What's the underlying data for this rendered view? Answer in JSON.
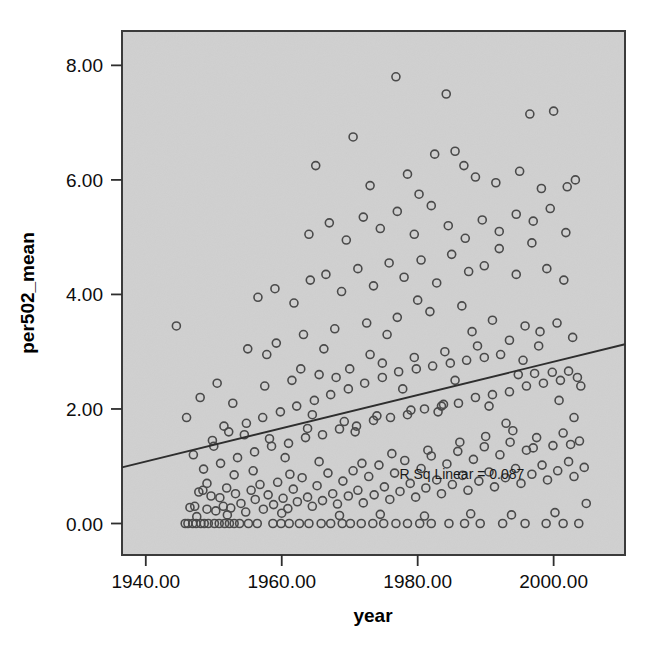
{
  "chart_data": {
    "type": "scatter",
    "title": "",
    "xlabel": "year",
    "ylabel": "per502_mean",
    "xlim": [
      1936.5,
      2010.5
    ],
    "ylim": [
      -0.55,
      8.6
    ],
    "xticks": [
      "1940.00",
      "1960.00",
      "1980.00",
      "2000.00"
    ],
    "xtick_values": [
      1940,
      1960,
      1980,
      2000
    ],
    "yticks": [
      "0.00",
      "2.00",
      "4.00",
      "6.00",
      "8.00"
    ],
    "ytick_values": [
      0,
      2,
      4,
      6,
      8
    ],
    "grid": false,
    "legend": null,
    "annotations": [
      {
        "text": "R Sq Linear = 0.087",
        "x": 1986.5,
        "y": 0.78
      }
    ],
    "fit_line": {
      "type": "linear",
      "r_squared": 0.087,
      "x_start": 1936.5,
      "y_start": 0.98,
      "x_end": 2010.5,
      "y_end": 3.13
    },
    "marker": {
      "shape": "circle",
      "filled": false,
      "edge_color": "#4a4a4a",
      "size_px": 8
    },
    "plot_background": "#dcdcdc",
    "frame_color": "#3a3a3a",
    "points": [
      [
        1944.5,
        3.45
      ],
      [
        1945.8,
        0.0
      ],
      [
        1946.2,
        0.0
      ],
      [
        1946.9,
        0.0
      ],
      [
        1947.4,
        0.0
      ],
      [
        1948.1,
        0.0
      ],
      [
        1948.6,
        0.0
      ],
      [
        1949.2,
        0.0
      ],
      [
        1950.1,
        0.0
      ],
      [
        1950.8,
        0.0
      ],
      [
        1951.6,
        0.0
      ],
      [
        1952.3,
        0.0
      ],
      [
        1953.0,
        0.0
      ],
      [
        1953.8,
        0.0
      ],
      [
        1955.1,
        0.0
      ],
      [
        1956.4,
        0.0
      ],
      [
        1958.7,
        0.0
      ],
      [
        1959.9,
        0.0
      ],
      [
        1961.1,
        0.0
      ],
      [
        1962.6,
        0.0
      ],
      [
        1964.0,
        0.0
      ],
      [
        1965.8,
        0.0
      ],
      [
        1967.2,
        0.0
      ],
      [
        1968.9,
        0.0
      ],
      [
        1970.1,
        0.0
      ],
      [
        1971.7,
        0.0
      ],
      [
        1973.4,
        0.0
      ],
      [
        1975.0,
        0.0
      ],
      [
        1976.8,
        0.0
      ],
      [
        1978.5,
        0.0
      ],
      [
        1980.3,
        0.0
      ],
      [
        1982.0,
        0.0
      ],
      [
        1984.6,
        0.0
      ],
      [
        1986.9,
        0.0
      ],
      [
        1989.2,
        0.0
      ],
      [
        1992.5,
        0.0
      ],
      [
        1995.8,
        0.0
      ],
      [
        1998.9,
        0.0
      ],
      [
        2001.4,
        0.0
      ],
      [
        2003.7,
        0.0
      ],
      [
        1946.5,
        0.28
      ],
      [
        1947.2,
        0.3
      ],
      [
        1947.8,
        0.55
      ],
      [
        1948.4,
        0.58
      ],
      [
        1949.0,
        0.25
      ],
      [
        1949.6,
        0.48
      ],
      [
        1950.3,
        0.22
      ],
      [
        1950.9,
        0.45
      ],
      [
        1951.4,
        0.3
      ],
      [
        1951.9,
        0.62
      ],
      [
        1952.5,
        0.27
      ],
      [
        1953.2,
        0.52
      ],
      [
        1954.0,
        0.35
      ],
      [
        1954.7,
        0.2
      ],
      [
        1955.5,
        0.58
      ],
      [
        1956.1,
        0.42
      ],
      [
        1956.8,
        0.68
      ],
      [
        1957.3,
        0.25
      ],
      [
        1958.0,
        0.5
      ],
      [
        1958.8,
        0.33
      ],
      [
        1959.4,
        0.72
      ],
      [
        1960.2,
        0.44
      ],
      [
        1960.9,
        0.26
      ],
      [
        1961.7,
        0.6
      ],
      [
        1962.3,
        0.38
      ],
      [
        1963.0,
        0.8
      ],
      [
        1963.8,
        0.46
      ],
      [
        1964.5,
        0.3
      ],
      [
        1965.2,
        0.66
      ],
      [
        1966.0,
        0.4
      ],
      [
        1966.8,
        0.88
      ],
      [
        1967.5,
        0.52
      ],
      [
        1968.2,
        0.34
      ],
      [
        1969.0,
        0.74
      ],
      [
        1969.8,
        0.48
      ],
      [
        1970.5,
        0.92
      ],
      [
        1971.2,
        0.58
      ],
      [
        1972.0,
        0.36
      ],
      [
        1972.8,
        0.82
      ],
      [
        1973.6,
        0.5
      ],
      [
        1974.3,
        1.02
      ],
      [
        1975.1,
        0.64
      ],
      [
        1975.9,
        0.42
      ],
      [
        1976.6,
        0.88
      ],
      [
        1977.4,
        0.56
      ],
      [
        1978.1,
        1.1
      ],
      [
        1978.9,
        0.7
      ],
      [
        1979.7,
        0.46
      ],
      [
        1980.5,
        0.96
      ],
      [
        1981.2,
        0.62
      ],
      [
        1982.0,
        1.18
      ],
      [
        1982.8,
        0.76
      ],
      [
        1983.5,
        0.52
      ],
      [
        1984.3,
        1.04
      ],
      [
        1985.1,
        0.68
      ],
      [
        1985.9,
        1.26
      ],
      [
        1986.6,
        0.84
      ],
      [
        1987.4,
        0.58
      ],
      [
        1988.2,
        1.12
      ],
      [
        1989.0,
        0.74
      ],
      [
        1989.8,
        1.34
      ],
      [
        1990.5,
        0.9
      ],
      [
        1991.3,
        0.64
      ],
      [
        1992.1,
        1.2
      ],
      [
        1992.9,
        0.8
      ],
      [
        1993.6,
        1.42
      ],
      [
        1994.4,
        0.96
      ],
      [
        1995.2,
        0.7
      ],
      [
        1996.0,
        1.28
      ],
      [
        1996.8,
        0.86
      ],
      [
        1997.5,
        1.5
      ],
      [
        1998.3,
        1.02
      ],
      [
        1999.1,
        0.76
      ],
      [
        1999.9,
        1.36
      ],
      [
        2000.6,
        0.92
      ],
      [
        2001.4,
        1.58
      ],
      [
        2002.2,
        1.08
      ],
      [
        2003.0,
        0.82
      ],
      [
        2003.8,
        1.44
      ],
      [
        2004.5,
        0.98
      ],
      [
        1947.0,
        1.2
      ],
      [
        1948.5,
        0.95
      ],
      [
        1949.8,
        1.45
      ],
      [
        1951.0,
        1.05
      ],
      [
        1952.2,
        1.6
      ],
      [
        1953.5,
        1.15
      ],
      [
        1954.8,
        1.75
      ],
      [
        1956.0,
        1.25
      ],
      [
        1957.2,
        1.85
      ],
      [
        1958.5,
        1.35
      ],
      [
        1959.8,
        1.95
      ],
      [
        1961.0,
        1.4
      ],
      [
        1962.2,
        2.05
      ],
      [
        1963.5,
        1.5
      ],
      [
        1964.8,
        2.15
      ],
      [
        1966.0,
        1.55
      ],
      [
        1967.2,
        2.25
      ],
      [
        1968.5,
        1.65
      ],
      [
        1969.8,
        2.35
      ],
      [
        1971.0,
        1.7
      ],
      [
        1972.2,
        2.45
      ],
      [
        1973.5,
        1.8
      ],
      [
        1974.8,
        2.55
      ],
      [
        1976.0,
        1.85
      ],
      [
        1977.2,
        2.65
      ],
      [
        1978.5,
        1.9
      ],
      [
        1979.8,
        2.7
      ],
      [
        1981.0,
        2.0
      ],
      [
        1982.2,
        2.75
      ],
      [
        1983.5,
        2.05
      ],
      [
        1984.8,
        2.8
      ],
      [
        1986.0,
        2.1
      ],
      [
        1987.2,
        2.85
      ],
      [
        1988.5,
        2.2
      ],
      [
        1989.8,
        2.9
      ],
      [
        1991.0,
        2.25
      ],
      [
        1992.2,
        2.95
      ],
      [
        1993.5,
        2.3
      ],
      [
        1994.8,
        2.6
      ],
      [
        1996.0,
        2.4
      ],
      [
        1997.2,
        2.62
      ],
      [
        1998.5,
        2.45
      ],
      [
        1999.8,
        2.64
      ],
      [
        2001.0,
        2.5
      ],
      [
        2002.2,
        2.66
      ],
      [
        2003.5,
        2.55
      ],
      [
        1950.5,
        2.45
      ],
      [
        1952.8,
        2.1
      ],
      [
        1955.0,
        3.05
      ],
      [
        1957.5,
        2.4
      ],
      [
        1959.2,
        3.15
      ],
      [
        1961.5,
        2.5
      ],
      [
        1963.2,
        3.3
      ],
      [
        1965.5,
        2.6
      ],
      [
        1967.8,
        3.4
      ],
      [
        1970.0,
        2.7
      ],
      [
        1972.5,
        3.5
      ],
      [
        1974.8,
        2.8
      ],
      [
        1977.0,
        3.6
      ],
      [
        1979.5,
        2.9
      ],
      [
        1981.8,
        3.7
      ],
      [
        1984.0,
        3.0
      ],
      [
        1986.5,
        3.8
      ],
      [
        1988.8,
        3.1
      ],
      [
        1991.0,
        3.55
      ],
      [
        1993.5,
        3.2
      ],
      [
        1995.8,
        3.45
      ],
      [
        1998.0,
        3.35
      ],
      [
        2000.5,
        3.5
      ],
      [
        2002.8,
        3.25
      ],
      [
        1956.5,
        3.95
      ],
      [
        1959.0,
        4.1
      ],
      [
        1961.8,
        3.85
      ],
      [
        1964.2,
        4.25
      ],
      [
        1966.5,
        4.35
      ],
      [
        1968.8,
        4.05
      ],
      [
        1971.2,
        4.45
      ],
      [
        1973.5,
        4.15
      ],
      [
        1975.8,
        4.55
      ],
      [
        1978.0,
        4.3
      ],
      [
        1980.5,
        4.6
      ],
      [
        1982.8,
        4.2
      ],
      [
        1985.0,
        4.7
      ],
      [
        1987.5,
        4.4
      ],
      [
        1989.8,
        4.5
      ],
      [
        1992.0,
        4.8
      ],
      [
        1994.5,
        4.35
      ],
      [
        1996.8,
        4.9
      ],
      [
        1999.0,
        4.45
      ],
      [
        2001.5,
        4.25
      ],
      [
        1964.0,
        5.05
      ],
      [
        1967.0,
        5.25
      ],
      [
        1969.5,
        4.95
      ],
      [
        1972.0,
        5.35
      ],
      [
        1974.5,
        5.15
      ],
      [
        1977.0,
        5.45
      ],
      [
        1979.5,
        5.05
      ],
      [
        1982.0,
        5.55
      ],
      [
        1984.5,
        5.2
      ],
      [
        1987.0,
        4.98
      ],
      [
        1989.5,
        5.3
      ],
      [
        1992.0,
        5.1
      ],
      [
        1994.5,
        5.4
      ],
      [
        1997.0,
        5.28
      ],
      [
        1999.5,
        5.5
      ],
      [
        2001.8,
        5.08
      ],
      [
        1965.0,
        6.25
      ],
      [
        1970.5,
        6.75
      ],
      [
        1973.0,
        5.9
      ],
      [
        1976.8,
        7.8
      ],
      [
        1978.5,
        6.1
      ],
      [
        1980.2,
        5.75
      ],
      [
        1982.5,
        6.45
      ],
      [
        1984.2,
        7.5
      ],
      [
        1985.5,
        6.5
      ],
      [
        1986.8,
        6.25
      ],
      [
        1988.5,
        6.05
      ],
      [
        1991.5,
        5.95
      ],
      [
        1995.0,
        6.15
      ],
      [
        1996.5,
        7.15
      ],
      [
        1998.2,
        5.85
      ],
      [
        2000.0,
        7.2
      ],
      [
        2002.0,
        5.88
      ],
      [
        2003.2,
        6.0
      ],
      [
        1946.0,
        1.85
      ],
      [
        1948.0,
        2.2
      ],
      [
        1950.0,
        1.35
      ],
      [
        1953.0,
        0.85
      ],
      [
        1954.5,
        1.55
      ],
      [
        1957.8,
        2.95
      ],
      [
        1960.5,
        1.15
      ],
      [
        1962.8,
        2.7
      ],
      [
        1964.5,
        1.9
      ],
      [
        1966.2,
        3.05
      ],
      [
        1968.0,
        2.55
      ],
      [
        1970.8,
        1.6
      ],
      [
        1973.0,
        2.95
      ],
      [
        1975.5,
        3.3
      ],
      [
        1977.8,
        2.35
      ],
      [
        1980.0,
        3.9
      ],
      [
        1983.0,
        1.95
      ],
      [
        1985.5,
        2.5
      ],
      [
        1988.0,
        3.35
      ],
      [
        1990.5,
        2.05
      ],
      [
        1993.0,
        1.75
      ],
      [
        1995.5,
        2.85
      ],
      [
        1997.8,
        3.1
      ],
      [
        2000.8,
        2.15
      ],
      [
        2003.0,
        1.85
      ],
      [
        2004.0,
        2.4
      ],
      [
        1949.0,
        0.7
      ],
      [
        1951.5,
        1.7
      ],
      [
        1955.8,
        0.92
      ],
      [
        1958.2,
        1.48
      ],
      [
        1961.2,
        0.86
      ],
      [
        1963.8,
        1.66
      ],
      [
        1965.5,
        1.08
      ],
      [
        1969.2,
        1.78
      ],
      [
        1971.8,
        1.05
      ],
      [
        1974.0,
        1.88
      ],
      [
        1976.2,
        1.22
      ],
      [
        1979.0,
        1.98
      ],
      [
        1981.5,
        1.28
      ],
      [
        1983.8,
        2.08
      ],
      [
        1986.2,
        1.42
      ],
      [
        1990.0,
        1.52
      ],
      [
        1994.0,
        1.62
      ],
      [
        1997.0,
        1.32
      ],
      [
        2002.5,
        1.38
      ],
      [
        1947.5,
        0.12
      ],
      [
        1952.0,
        0.15
      ],
      [
        1960.0,
        0.18
      ],
      [
        1968.5,
        0.14
      ],
      [
        1974.5,
        0.16
      ],
      [
        1981.0,
        0.13
      ],
      [
        1987.8,
        0.17
      ],
      [
        1993.8,
        0.15
      ],
      [
        2000.2,
        0.19
      ],
      [
        2004.8,
        0.35
      ]
    ]
  }
}
